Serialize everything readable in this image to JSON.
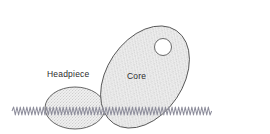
{
  "figure": {
    "type": "scientific-schematic",
    "background_color": "#ffffff",
    "outline_color": "#4a4a4a",
    "fill_color": "#e8e8e8",
    "stipple_color": "#9a9a9a",
    "membrane_color": "#8e8e9c",
    "labels": [
      {
        "id": "headpiece",
        "text": "Headpiece",
        "x": 47,
        "y": 69
      },
      {
        "id": "core",
        "text": "Core",
        "x": 127,
        "y": 71
      }
    ],
    "shapes": {
      "headpiece_ellipse": {
        "name": "headpiece",
        "cx": 75,
        "cy": 108,
        "rx": 30,
        "ry": 21,
        "rotation": 0
      },
      "core_ellipse": {
        "name": "core",
        "cx": 145,
        "cy": 77,
        "rx": 56,
        "ry": 38,
        "rotation": -56
      },
      "core_pore": {
        "name": "pore",
        "cx": 163,
        "cy": 47,
        "r": 8.5,
        "fill": "#ffffff"
      },
      "membrane": {
        "name": "membrane-wave",
        "x_start": 12,
        "x_end": 216,
        "y_center": 111,
        "amplitude": 4,
        "wavelength": 6.6
      }
    }
  }
}
